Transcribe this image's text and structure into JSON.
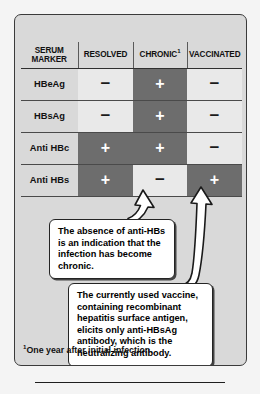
{
  "figure": {
    "panel_bg": "#d9d9d9",
    "cell_dark": "#6d6d6d",
    "cell_light": "#e9e9e9",
    "border_color": "#3b3b3b"
  },
  "table": {
    "headers": {
      "marker_line1": "SERUM",
      "marker_line2": "MARKER",
      "resolved": "RESOLVED",
      "chronic": "CHRONIC",
      "chronic_footnote_mark": "1",
      "vaccinated": "VACCINATED"
    },
    "rows": [
      {
        "marker": "HBeAg",
        "cells": [
          {
            "value": "−",
            "state": "negative",
            "shade": "light"
          },
          {
            "value": "+",
            "state": "positive",
            "shade": "dark"
          },
          {
            "value": "−",
            "state": "negative",
            "shade": "light"
          }
        ]
      },
      {
        "marker": "HBsAg",
        "cells": [
          {
            "value": "−",
            "state": "negative",
            "shade": "light"
          },
          {
            "value": "+",
            "state": "positive",
            "shade": "dark"
          },
          {
            "value": "−",
            "state": "negative",
            "shade": "light"
          }
        ]
      },
      {
        "marker": "Anti HBc",
        "cells": [
          {
            "value": "+",
            "state": "positive",
            "shade": "dark"
          },
          {
            "value": "+",
            "state": "positive",
            "shade": "dark"
          },
          {
            "value": "−",
            "state": "negative",
            "shade": "light"
          }
        ]
      },
      {
        "marker": "Anti HBs",
        "cells": [
          {
            "value": "+",
            "state": "positive",
            "shade": "dark"
          },
          {
            "value": "−",
            "state": "negative",
            "shade": "light"
          },
          {
            "value": "+",
            "state": "positive",
            "shade": "dark"
          }
        ]
      }
    ]
  },
  "callouts": [
    {
      "id": "anti-hbs-absence",
      "text": "The absence of anti-HBs is an indication that the infection has become chronic.",
      "points_to": "Anti HBs / CHRONIC"
    },
    {
      "id": "vaccine-note",
      "text": "The currently used vaccine, containing recombinant hepatitis surface antigen, elicits only anti-HBsAg antibody, which is the neutralizing antibody.",
      "points_to": "Anti HBs / VACCINATED"
    }
  ],
  "footnote": {
    "mark": "1",
    "text": "One year after initial infection."
  }
}
